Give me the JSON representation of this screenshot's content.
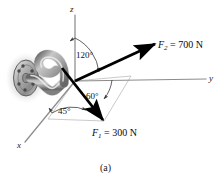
{
  "figure": {
    "caption": "(a)",
    "axes": {
      "z_label": "z",
      "y_label": "y",
      "x_label": "x"
    },
    "angles": {
      "from_z_to_F2": "120°",
      "from_y_to_F1_plane": "60°",
      "from_x_to_F1_projection": "45°"
    },
    "forces": {
      "F2": {
        "name": "F",
        "subscript": "2",
        "equals": "= 700 N",
        "full_label": "F2 = 700 N",
        "magnitude": 700,
        "unit": "N"
      },
      "F1": {
        "name": "F",
        "subscript": "1",
        "equals": "= 300 N",
        "full_label": "F1 = 300 N",
        "magnitude": 300,
        "unit": "N"
      }
    },
    "object": {
      "name": "wall-mounted-hook",
      "flange_bolts": 6
    },
    "colors": {
      "axis": "#8c8c8c",
      "force_vector": "#000000",
      "projection_line": "#b8b8b8",
      "hook_fill": "#9a9a9a",
      "hook_highlight": "#e2e2e2",
      "hook_shadow": "#5e5e5e",
      "plate": "#a6a6a6",
      "background": "#ffffff"
    }
  }
}
